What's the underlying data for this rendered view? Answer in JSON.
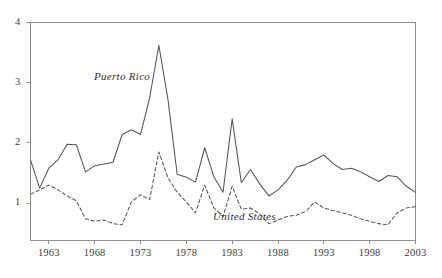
{
  "chart_data": {
    "type": "line",
    "title": "",
    "subtitle": "",
    "xlabel": "",
    "ylabel": "",
    "xlim": [
      1961,
      2003
    ],
    "ylim": [
      0.38,
      4.0
    ],
    "grid": false,
    "legend_position": "inline-annotation",
    "x_ticks": [
      1963,
      1968,
      1973,
      1978,
      1983,
      1988,
      1993,
      1998,
      2003
    ],
    "x_tick_labels": [
      "1963",
      "1968",
      "1973",
      "1978",
      "1983",
      "1988",
      "1993",
      "1998",
      "2003"
    ],
    "y_ticks": [
      1,
      2,
      3,
      4
    ],
    "y_tick_labels": [
      "1",
      "2",
      "3",
      "4"
    ],
    "x": [
      1961,
      1962,
      1963,
      1964,
      1965,
      1966,
      1967,
      1968,
      1969,
      1970,
      1971,
      1972,
      1973,
      1974,
      1975,
      1976,
      1977,
      1978,
      1979,
      1980,
      1981,
      1982,
      1983,
      1984,
      1985,
      1986,
      1987,
      1988,
      1989,
      1990,
      1991,
      1992,
      1993,
      1994,
      1995,
      1996,
      1997,
      1998,
      1999,
      2000,
      2001,
      2002,
      2003
    ],
    "series": [
      {
        "name": "Puerto Rico",
        "style": "solid",
        "color": "#555555",
        "values": [
          1.72,
          1.25,
          1.58,
          1.72,
          1.98,
          1.97,
          1.52,
          1.62,
          1.65,
          1.68,
          2.14,
          2.22,
          2.14,
          2.75,
          3.62,
          2.72,
          1.48,
          1.43,
          1.35,
          1.92,
          1.44,
          1.18,
          2.4,
          1.34,
          1.56,
          1.32,
          1.12,
          1.22,
          1.38,
          1.6,
          1.64,
          1.72,
          1.8,
          1.66,
          1.56,
          1.58,
          1.52,
          1.44,
          1.36,
          1.46,
          1.44,
          1.28,
          1.18
        ]
      },
      {
        "name": "United States",
        "style": "dashed",
        "color": "#555555",
        "values": [
          1.15,
          1.22,
          1.3,
          1.22,
          1.12,
          1.04,
          0.74,
          0.7,
          0.72,
          0.66,
          0.64,
          1.02,
          1.14,
          1.06,
          1.85,
          1.42,
          1.18,
          1.02,
          0.84,
          1.3,
          0.92,
          0.78,
          1.28,
          0.9,
          0.92,
          0.82,
          0.66,
          0.72,
          0.78,
          0.8,
          0.86,
          1.02,
          0.92,
          0.88,
          0.84,
          0.8,
          0.74,
          0.7,
          0.66,
          0.64,
          0.84,
          0.92,
          0.94
        ]
      }
    ],
    "annotations": [
      {
        "text": "Puerto Rico",
        "x_px": 94,
        "y_px": 70
      },
      {
        "text": "United States",
        "x_px": 213,
        "y_px": 210
      }
    ],
    "axis_color": "#8d8d8d",
    "background_color": "#ffffff"
  }
}
